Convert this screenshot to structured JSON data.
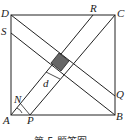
{
  "figure": {
    "labels": {
      "A": "A",
      "B": "B",
      "C": "C",
      "D": "D",
      "S": "S",
      "R": "R",
      "Q": "Q",
      "P": "P",
      "N": "N",
      "d": "d"
    },
    "caption": "第 5 题答图",
    "colors": {
      "line": "#222222",
      "shaded": "#666666",
      "background": "#ffffff"
    }
  }
}
